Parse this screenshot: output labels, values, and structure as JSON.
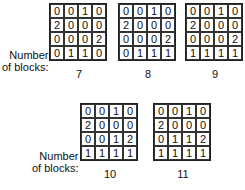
{
  "label_text": [
    "Number",
    "of blocks:"
  ],
  "configurations": [
    {
      "blocks": "7",
      "grid": [
        [
          "0",
          "0",
          "1",
          "0"
        ],
        [
          "2",
          "0",
          "0",
          "0"
        ],
        [
          "0",
          "0",
          "0",
          "2"
        ],
        [
          "0",
          "1",
          "1",
          "0"
        ]
      ]
    },
    {
      "blocks": "8",
      "grid": [
        [
          "0",
          "0",
          "1",
          "0"
        ],
        [
          "2",
          "0",
          "0",
          "0"
        ],
        [
          "0",
          "0",
          "0",
          "2"
        ],
        [
          "0",
          "1",
          "1",
          "1"
        ]
      ]
    },
    {
      "blocks": "9",
      "grid": [
        [
          "0",
          "0",
          "1",
          "0"
        ],
        [
          "2",
          "0",
          "0",
          "0"
        ],
        [
          "0",
          "0",
          "0",
          "2"
        ],
        [
          "1",
          "1",
          "1",
          "1"
        ]
      ]
    },
    {
      "blocks": "10",
      "grid": [
        [
          "0",
          "0",
          "1",
          "0"
        ],
        [
          "2",
          "0",
          "0",
          "0"
        ],
        [
          "0",
          "0",
          "1",
          "2"
        ],
        [
          "1",
          "1",
          "1",
          "1"
        ]
      ]
    },
    {
      "blocks": "11",
      "grid": [
        [
          "0",
          "0",
          "1",
          "0"
        ],
        [
          "2",
          "0",
          "0",
          "0"
        ],
        [
          "0",
          "1",
          "1",
          "2"
        ],
        [
          "1",
          "1",
          "1",
          "1"
        ]
      ]
    }
  ]
}
